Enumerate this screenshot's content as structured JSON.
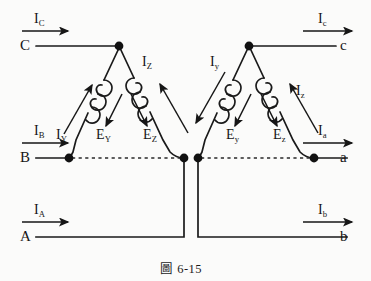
{
  "figure": {
    "caption": "圖 6-15",
    "caption_prefix": "圖",
    "caption_number": "6-15",
    "type": "delta-delta transformer connection diagram",
    "line_color": "#1a1a1a",
    "node_color": "#111111",
    "background": "#fbfbfa"
  },
  "terminals": {
    "primary": [
      {
        "id": "C",
        "label": "C",
        "side": "left",
        "row": "top"
      },
      {
        "id": "B",
        "label": "B",
        "side": "left",
        "row": "middle"
      },
      {
        "id": "A",
        "label": "A",
        "side": "left",
        "row": "bottom"
      }
    ],
    "secondary": [
      {
        "id": "c",
        "label": "c",
        "side": "right",
        "row": "top"
      },
      {
        "id": "a",
        "label": "a",
        "side": "right",
        "row": "middle"
      },
      {
        "id": "b",
        "label": "b",
        "side": "right",
        "row": "bottom"
      }
    ]
  },
  "currents": {
    "line_left": [
      {
        "symbol": "I",
        "subscript": "C",
        "label": "I",
        "sub": "C",
        "position": "top-left",
        "direction": "right"
      },
      {
        "symbol": "I",
        "subscript": "B",
        "label": "I",
        "sub": "B",
        "position": "middle-left",
        "direction": "right"
      },
      {
        "symbol": "I",
        "subscript": "A",
        "label": "I",
        "sub": "A",
        "position": "bottom-left",
        "direction": "right"
      }
    ],
    "line_right": [
      {
        "symbol": "I",
        "subscript": "c",
        "label": "I",
        "sub": "c",
        "position": "top-right",
        "direction": "right"
      },
      {
        "symbol": "I",
        "subscript": "a",
        "label": "I",
        "sub": "a",
        "position": "middle-right",
        "direction": "right"
      },
      {
        "symbol": "I",
        "subscript": "b",
        "label": "I",
        "sub": "b",
        "position": "bottom-right",
        "direction": "right"
      }
    ],
    "winding_primary": [
      {
        "label": "I",
        "sub": "Y",
        "winding": "left-triangle-left-leg",
        "direction": "up-right"
      },
      {
        "label": "I",
        "sub": "Z",
        "winding": "left-triangle-right-leg",
        "direction": "up-left"
      }
    ],
    "winding_secondary": [
      {
        "label": "I",
        "sub": "y",
        "winding": "right-triangle-left-leg",
        "direction": "down-left"
      },
      {
        "label": "I",
        "sub": "z",
        "winding": "right-triangle-right-leg",
        "direction": "up-left"
      }
    ]
  },
  "emfs": {
    "primary": [
      {
        "label": "E",
        "sub": "Y",
        "winding": "left-triangle-left-leg",
        "direction": "down-right"
      },
      {
        "label": "E",
        "sub": "Z",
        "winding": "left-triangle-right-leg",
        "direction": "down-left"
      }
    ],
    "secondary": [
      {
        "label": "E",
        "sub": "y",
        "winding": "right-triangle-left-leg",
        "direction": "down-right"
      },
      {
        "label": "E",
        "sub": "z",
        "winding": "right-triangle-right-leg",
        "direction": "down-left"
      }
    ]
  },
  "windings": {
    "count": 4,
    "coil_turns": 3,
    "left_triangle_apex": "C-node",
    "right_triangle_apex": "c-node"
  },
  "connections": {
    "dashed_segments": [
      {
        "from": "B-node",
        "to": "left-triangle-bottom-right-node"
      },
      {
        "from": "right-triangle-bottom-left-node",
        "to": "a-node"
      }
    ],
    "solid_leads": [
      {
        "from": "C",
        "to": "left-triangle-apex"
      },
      {
        "from": "right-triangle-apex",
        "to": "c"
      },
      {
        "from": "A",
        "to": "left-triangle-bottom-right-node"
      },
      {
        "from": "right-triangle-bottom-left-node",
        "to": "b"
      }
    ]
  }
}
